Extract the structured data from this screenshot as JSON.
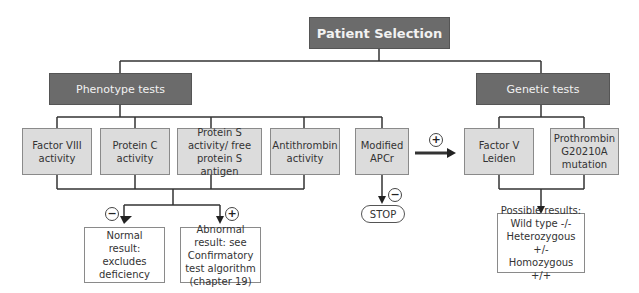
{
  "title": "Patient Selection",
  "branches": {
    "phenotype": {
      "label": "Phenotype tests",
      "tests": [
        {
          "label": "Factor VIII activity"
        },
        {
          "label": "Protein C activity"
        },
        {
          "label": "Protein S activity/ free protein S antigen"
        },
        {
          "label": "Antithrombin activity"
        },
        {
          "label": "Modified APCr"
        }
      ],
      "outcomes": {
        "negative": {
          "sign": "−",
          "label": "Normal result: excludes deficiency"
        },
        "positive": {
          "sign": "+",
          "label": "Abnormal result: see Confirmatory test algorithm (chapter 19)"
        }
      },
      "apcr_negative": {
        "sign": "−",
        "label": "STOP"
      },
      "apcr_positive": {
        "sign": "+"
      }
    },
    "genetic": {
      "label": "Genetic tests",
      "tests": [
        {
          "label": "Factor V Leiden"
        },
        {
          "label": "Prothrombin G20210A mutation"
        }
      ],
      "results": {
        "heading": "Possible results:",
        "lines": [
          "Wild type -/-",
          "Heterozygous +/-",
          "Homozygous +/+"
        ]
      }
    }
  },
  "colors": {
    "header_fill": "#6b6b6b",
    "test_fill": "#dcdcdc",
    "line": "#333333"
  }
}
